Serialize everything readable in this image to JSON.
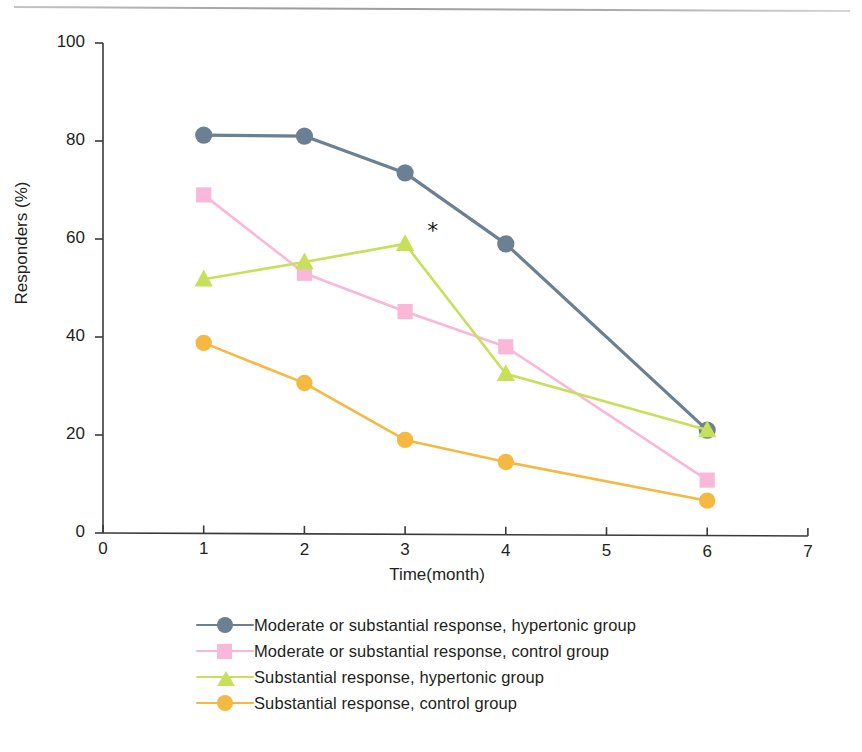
{
  "figure": {
    "axes": {
      "ylabel": "Responders (%)",
      "xlabel": "Time(month)",
      "yticks": [
        "0",
        "20",
        "40",
        "60",
        "80",
        "100"
      ],
      "xticks": [
        "0",
        "1",
        "2",
        "3",
        "4",
        "5",
        "6",
        "7"
      ]
    },
    "annotation": {
      "star": "*"
    }
  },
  "legend": {
    "items": [
      {
        "label": "Moderate or substantial response, hypertonic group",
        "color": "#6B8093",
        "marker": "circle"
      },
      {
        "label": "Moderate or substantial response, control group",
        "color": "#F9B8D8",
        "marker": "square"
      },
      {
        "label": "Substantial response, hypertonic group",
        "color": "#C6E05A",
        "marker": "triangle"
      },
      {
        "label": "Substantial response, control group",
        "color": "#F5B942",
        "marker": "circle"
      }
    ]
  },
  "chart_data": {
    "type": "line",
    "title": "",
    "xlabel": "Time(month)",
    "ylabel": "Responders (%)",
    "xlim": [
      0,
      7
    ],
    "ylim": [
      0,
      100
    ],
    "xticks": [
      0,
      1,
      2,
      3,
      4,
      5,
      6,
      7
    ],
    "yticks": [
      0,
      20,
      40,
      60,
      80,
      100
    ],
    "grid": false,
    "legend_position": "below",
    "x": [
      1,
      2,
      3,
      4,
      6
    ],
    "series": [
      {
        "name": "Moderate or substantial response, hypertonic group",
        "color": "#6B8093",
        "marker": "circle",
        "values": [
          81.2,
          81,
          73.5,
          59,
          21
        ]
      },
      {
        "name": "Moderate or substantial response, control group",
        "color": "#F9B8D8",
        "marker": "square",
        "values": [
          69,
          53,
          45.2,
          38,
          10.8
        ]
      },
      {
        "name": "Substantial response, hypertonic group",
        "color": "#C6E05A",
        "marker": "triangle",
        "values": [
          51.8,
          55.3,
          59,
          32.5,
          21
        ]
      },
      {
        "name": "Substantial response, control group",
        "color": "#F5B942",
        "marker": "circle",
        "values": [
          38.8,
          30.6,
          19,
          14.5,
          6.6
        ]
      }
    ],
    "annotations": [
      {
        "text": "*",
        "x": 3.2,
        "y": 61,
        "note": "significance marker at month 3 for substantial response, hypertonic group"
      }
    ]
  }
}
